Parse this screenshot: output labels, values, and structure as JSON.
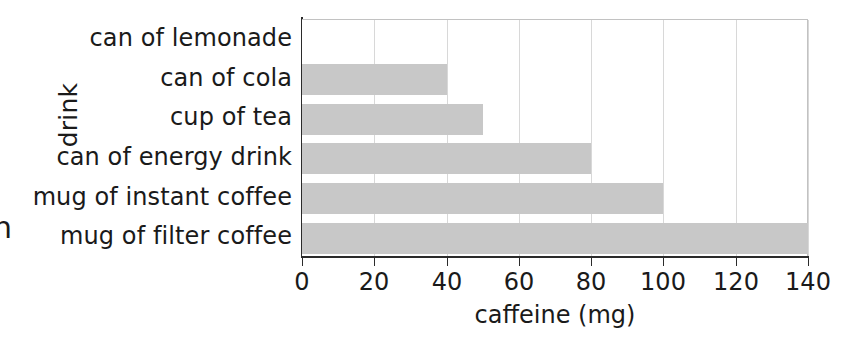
{
  "chart_data": {
    "type": "bar",
    "orientation": "horizontal",
    "title": "",
    "xlabel": "caffeine (mg)",
    "ylabel": "drink",
    "categories": [
      "can of lemonade",
      "can of cola",
      "cup of tea",
      "can of energy drink",
      "mug of instant coffee",
      "mug of filter coffee"
    ],
    "values": [
      0,
      40,
      50,
      80,
      100,
      140
    ],
    "xlim": [
      0,
      140
    ],
    "xticks": [
      0,
      20,
      40,
      60,
      80,
      100,
      120,
      140
    ],
    "xtick_labels": [
      "0",
      "20",
      "40",
      "60",
      "80",
      "100",
      "120",
      "140"
    ],
    "grid": "vertical",
    "legend": "none",
    "bar_color": "#c8c8c8",
    "axis_color": "#2b2b2b",
    "gridline_color": "#d8d8d8",
    "background_color": "#ffffff"
  },
  "page": {
    "edge_fragment": "n"
  }
}
